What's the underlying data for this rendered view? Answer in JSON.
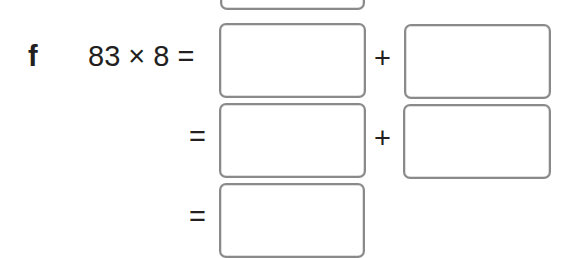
{
  "exercise": {
    "label": "f",
    "expression": "83 × 8 =",
    "rows": [
      {
        "prefix": "",
        "operator": "+",
        "boxes": 2
      },
      {
        "prefix": "=",
        "operator": "+",
        "boxes": 2
      },
      {
        "prefix": "=",
        "operator": "",
        "boxes": 1
      }
    ],
    "line1_op": "+",
    "line2_eq": "=",
    "line2_op": "+",
    "line3_eq": "="
  },
  "answer_boxes": {
    "previous_exercise_box": "",
    "row1_box1": "",
    "row1_box2": "",
    "row2_box1": "",
    "row2_box2": "",
    "row3_box1": ""
  }
}
